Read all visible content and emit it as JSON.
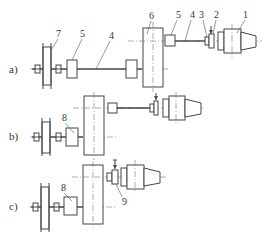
{
  "figure": {
    "variants": [
      {
        "label": "a)",
        "callouts": [
          "1",
          "2",
          "3",
          "4",
          "5",
          "6",
          "5",
          "4",
          "7"
        ]
      },
      {
        "label": "b)",
        "callouts": [
          "8"
        ]
      },
      {
        "label": "c)",
        "callouts": [
          "8",
          "9"
        ]
      }
    ]
  },
  "labels": {
    "a": "a)",
    "b": "b)",
    "c": "c)"
  },
  "callouts": {
    "n1": "1",
    "n2": "2",
    "n3": "3",
    "n4_top": "4",
    "n5_top": "5",
    "n6": "6",
    "n5_left": "5",
    "n4_left": "4",
    "n7": "7",
    "n8_b": "8",
    "n8_c": "8",
    "n9": "9"
  },
  "colors": {
    "line": "#444444",
    "background": "#ffffff"
  }
}
